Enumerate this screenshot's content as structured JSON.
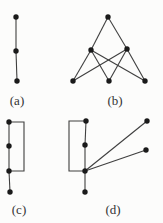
{
  "figure": {
    "background": "#fcfcfb",
    "node_color": "#1a1a1a",
    "edge_color": "#3f3f3f",
    "label_color": "#333333",
    "node_radius": 2.7,
    "edge_width": 1.1,
    "label_font_size": 13,
    "graphs": [
      {
        "id": "a",
        "label": "(a)",
        "label_pos": [
          17,
          105
        ],
        "nodes": [
          [
            16,
            17
          ],
          [
            16,
            51
          ],
          [
            17,
            81
          ]
        ],
        "edges": [
          [
            0,
            1
          ],
          [
            1,
            2
          ]
        ],
        "bent_edges": []
      },
      {
        "id": "b",
        "label": "(b)",
        "label_pos": [
          115,
          105
        ],
        "nodes": [
          [
            108,
            17
          ],
          [
            91,
            50
          ],
          [
            127,
            49
          ],
          [
            73,
            81
          ],
          [
            109,
            81
          ],
          [
            145,
            81
          ]
        ],
        "edges": [
          [
            0,
            1
          ],
          [
            0,
            2
          ],
          [
            1,
            3
          ],
          [
            1,
            4
          ],
          [
            1,
            5
          ],
          [
            2,
            3
          ],
          [
            2,
            4
          ],
          [
            2,
            5
          ]
        ],
        "bent_edges": []
      },
      {
        "id": "c",
        "label": "(c)",
        "label_pos": [
          19,
          214
        ],
        "nodes": [
          [
            9,
            122
          ],
          [
            9,
            146
          ],
          [
            9,
            171
          ],
          [
            10,
            192
          ]
        ],
        "edges": [
          [
            0,
            1
          ],
          [
            1,
            2
          ],
          [
            2,
            3
          ]
        ],
        "bent_edges": [
          [
            [
              9,
              122
            ],
            [
              24,
              122
            ],
            [
              24,
              171
            ],
            [
              9,
              171
            ]
          ]
        ]
      },
      {
        "id": "d",
        "label": "(d)",
        "label_pos": [
          113,
          214
        ],
        "nodes": [
          [
            86,
            121
          ],
          [
            85,
            145
          ],
          [
            85,
            171
          ],
          [
            85,
            192
          ],
          [
            147,
            121
          ],
          [
            146,
            150
          ]
        ],
        "edges": [
          [
            0,
            1
          ],
          [
            1,
            2
          ],
          [
            2,
            3
          ],
          [
            2,
            4
          ],
          [
            2,
            5
          ]
        ],
        "bent_edges": [
          [
            [
              86,
              121
            ],
            [
              69,
              121
            ],
            [
              69,
              171
            ],
            [
              85,
              171
            ]
          ]
        ]
      }
    ]
  }
}
